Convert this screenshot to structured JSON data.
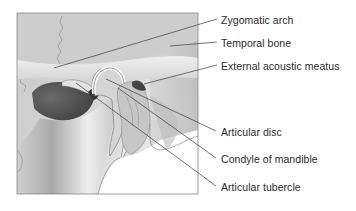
{
  "diagram": {
    "type": "anatomical-illustration",
    "labels": [
      {
        "id": "zygomatic-arch",
        "text": "Zygomatic arch",
        "x": 221,
        "y": 14
      },
      {
        "id": "temporal-bone",
        "text": "Temporal bone",
        "x": 221,
        "y": 37
      },
      {
        "id": "external-acoustic-meatus",
        "text": "External acoustic meatus",
        "x": 221,
        "y": 60
      },
      {
        "id": "articular-disc",
        "text": "Articular disc",
        "x": 221,
        "y": 126
      },
      {
        "id": "condyle-of-mandible",
        "text": "Condyle of mandible",
        "x": 221,
        "y": 153
      },
      {
        "id": "articular-tubercle",
        "text": "Articular tubercle",
        "x": 221,
        "y": 181
      }
    ],
    "colors": {
      "bone_light": "#e6e6e6",
      "bone_mid": "#c8c8c8",
      "bone_dark": "#9a9a9a",
      "cavity": "#555555",
      "frame": "#777777",
      "leader": "#3a3a3a",
      "text": "#2b2b2b"
    }
  }
}
